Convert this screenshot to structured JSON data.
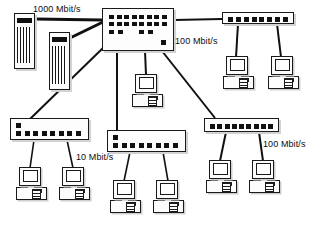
{
  "diagram": {
    "background_color": "#ffffff",
    "line_color": "#111111",
    "labels": [
      {
        "id": "gigabit",
        "text": "1000 Mbit/s",
        "x": 33,
        "y": 4
      },
      {
        "id": "fast-ethernet-top",
        "text": "100 Mbit/s",
        "x": 175,
        "y": 36
      },
      {
        "id": "ethernet-10",
        "text": "10 Mbit/s",
        "x": 76,
        "y": 152
      },
      {
        "id": "fast-ethernet-bottom",
        "text": "100 Mbit/s",
        "x": 263,
        "y": 139
      }
    ],
    "nodes": {
      "server_left": {
        "name": "Server 1",
        "x": 14,
        "y": 13,
        "w": 21,
        "h": 56
      },
      "server_right": {
        "name": "Server 2",
        "x": 49,
        "y": 32,
        "w": 21,
        "h": 58
      },
      "core_switch": {
        "name": "Core switch",
        "x": 102,
        "y": 8,
        "w": 72,
        "h": 43,
        "ports_top": 8,
        "ports_mid": 8,
        "ports_bottom": 4
      },
      "hub_top_right": {
        "name": "Hub top right",
        "x": 222,
        "y": 12,
        "w": 72,
        "h": 12,
        "ports": 8
      },
      "hub_bottom_left": {
        "name": "Hub bottom left",
        "x": 10,
        "y": 118,
        "w": 79,
        "h": 22,
        "ports": 8
      },
      "hub_bottom_middle": {
        "name": "Hub bottom middle",
        "x": 107,
        "y": 130,
        "w": 79,
        "h": 22,
        "ports": 8
      },
      "hub_bottom_right": {
        "name": "Hub bottom right",
        "x": 204,
        "y": 118,
        "w": 75,
        "h": 14,
        "ports": 9
      },
      "pc_center": {
        "name": "Workstation center",
        "x": 132,
        "y": 74,
        "w": 31,
        "h": 33
      },
      "pc_tr_1": {
        "name": "Workstation top right 1",
        "x": 223,
        "y": 56,
        "w": 31,
        "h": 33
      },
      "pc_tr_2": {
        "name": "Workstation top right 2",
        "x": 268,
        "y": 56,
        "w": 31,
        "h": 33
      },
      "pc_bl_1": {
        "name": "Workstation bottom left 1",
        "x": 16,
        "y": 167,
        "w": 31,
        "h": 33
      },
      "pc_bl_2": {
        "name": "Workstation bottom left 2",
        "x": 59,
        "y": 167,
        "w": 31,
        "h": 33
      },
      "pc_bm_1": {
        "name": "Workstation bottom middle 1",
        "x": 110,
        "y": 180,
        "w": 31,
        "h": 33
      },
      "pc_bm_2": {
        "name": "Workstation bottom middle 2",
        "x": 153,
        "y": 180,
        "w": 31,
        "h": 33
      },
      "pc_br_1": {
        "name": "Workstation bottom right 1",
        "x": 206,
        "y": 160,
        "w": 31,
        "h": 33
      },
      "pc_br_2": {
        "name": "Workstation bottom right 2",
        "x": 249,
        "y": 160,
        "w": 31,
        "h": 33
      }
    },
    "links": [
      {
        "id": "server-left-to-switch",
        "x1": 35,
        "y1": 19,
        "x2": 102,
        "y2": 20,
        "width": 3
      },
      {
        "id": "server-right-to-switch",
        "x1": 70,
        "y1": 38,
        "x2": 103,
        "y2": 22,
        "width": 3
      },
      {
        "id": "switch-to-hub-bottom-left",
        "x1": 103,
        "y1": 48,
        "x2": 30,
        "y2": 119,
        "width": 2
      },
      {
        "id": "switch-to-hub-top-right",
        "x1": 174,
        "y1": 20,
        "x2": 222,
        "y2": 19,
        "width": 2
      },
      {
        "id": "switch-to-pc-center",
        "x1": 145,
        "y1": 51,
        "x2": 146,
        "y2": 75,
        "width": 2
      },
      {
        "id": "switch-to-hub-bottom-middle",
        "x1": 117,
        "y1": 51,
        "x2": 117,
        "y2": 131,
        "width": 2
      },
      {
        "id": "switch-to-hub-bottom-right",
        "x1": 162,
        "y1": 51,
        "x2": 215,
        "y2": 118,
        "width": 2
      },
      {
        "id": "hub-tr-to-pc1",
        "x1": 238,
        "y1": 24,
        "x2": 236,
        "y2": 57,
        "width": 2
      },
      {
        "id": "hub-tr-to-pc2",
        "x1": 277,
        "y1": 24,
        "x2": 281,
        "y2": 57,
        "width": 2
      },
      {
        "id": "hub-bl-to-pc1",
        "x1": 34,
        "y1": 140,
        "x2": 30,
        "y2": 168,
        "width": 1.6
      },
      {
        "id": "hub-bl-to-pc2",
        "x1": 67,
        "y1": 140,
        "x2": 73,
        "y2": 168,
        "width": 1.6
      },
      {
        "id": "hub-bm-to-pc1",
        "x1": 130,
        "y1": 152,
        "x2": 124,
        "y2": 181,
        "width": 1.6
      },
      {
        "id": "hub-bm-to-pc2",
        "x1": 163,
        "y1": 152,
        "x2": 168,
        "y2": 181,
        "width": 1.6
      },
      {
        "id": "hub-br-to-pc1",
        "x1": 226,
        "y1": 132,
        "x2": 220,
        "y2": 161,
        "width": 2
      },
      {
        "id": "hub-br-to-pc2",
        "x1": 259,
        "y1": 132,
        "x2": 263,
        "y2": 161,
        "width": 2
      }
    ]
  }
}
